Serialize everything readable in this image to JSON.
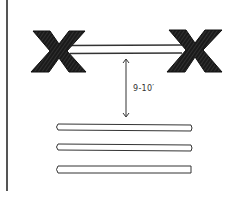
{
  "diagram": {
    "type": "hand-drawn sketch",
    "left_support": {
      "shape": "X",
      "label": ""
    },
    "right_support": {
      "shape": "X",
      "label": ""
    },
    "top_bar": {
      "label": ""
    },
    "dimension": {
      "label": "9-10′",
      "direction": "vertical",
      "arrowheads": "both"
    },
    "ground_bars": [
      {
        "index": 1
      },
      {
        "index": 2
      },
      {
        "index": 3
      }
    ],
    "colors": {
      "ink": "#1a1a1a",
      "line": "#555555",
      "background": "#ffffff"
    }
  }
}
